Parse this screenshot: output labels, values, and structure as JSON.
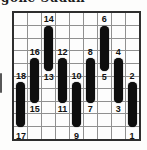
{
  "header": {
    "title_fragment": "gone Sudan"
  },
  "puzzle": {
    "columns": 9,
    "rows": 10,
    "bars": [
      {
        "col": 1,
        "band": "low",
        "top_label": "18",
        "bottom_label": "17"
      },
      {
        "col": 2,
        "band": "mid",
        "top_label": "16",
        "bottom_label": "15"
      },
      {
        "col": 3,
        "band": "high",
        "top_label": "14",
        "bottom_label": "13"
      },
      {
        "col": 4,
        "band": "mid",
        "top_label": "12",
        "bottom_label": "11"
      },
      {
        "col": 5,
        "band": "low",
        "top_label": "10",
        "bottom_label": "9"
      },
      {
        "col": 6,
        "band": "mid",
        "top_label": "8",
        "bottom_label": "7"
      },
      {
        "col": 7,
        "band": "high",
        "top_label": "6",
        "bottom_label": "5"
      },
      {
        "col": 8,
        "band": "mid",
        "top_label": "4",
        "bottom_label": "3"
      },
      {
        "col": 9,
        "band": "low",
        "top_label": "2",
        "bottom_label": "1"
      }
    ],
    "colors": {
      "capsule": "#0e0e0e",
      "grid_line": "#909090",
      "border": "#2e2e2e",
      "background": "#fdfdfd"
    }
  }
}
